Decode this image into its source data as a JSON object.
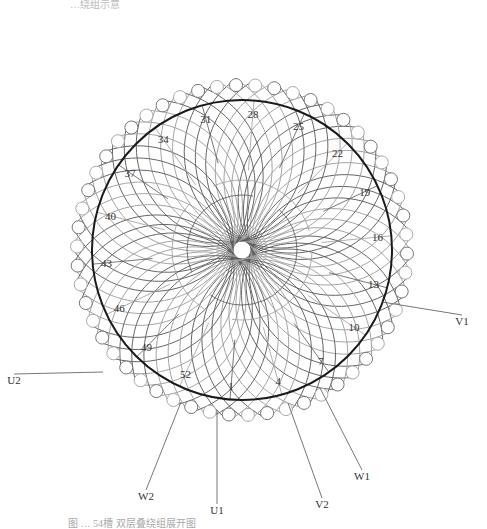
{
  "figure": {
    "top_caption": "…绕组示意",
    "bottom_caption": "图 …  54槽 双层叠绕组展开图",
    "slot_count": 54,
    "center": [
      242,
      250
    ],
    "stator_radius": 150,
    "slot_circle_radius": 165,
    "slot_numbers": [
      {
        "label": "1",
        "slot": 1
      },
      {
        "label": "4",
        "slot": 4
      },
      {
        "label": "7",
        "slot": 7
      },
      {
        "label": "10",
        "slot": 10
      },
      {
        "label": "13",
        "slot": 13
      },
      {
        "label": "16",
        "slot": 16
      },
      {
        "label": "19",
        "slot": 19
      },
      {
        "label": "22",
        "slot": 22
      },
      {
        "label": "25",
        "slot": 25
      },
      {
        "label": "28",
        "slot": 28
      },
      {
        "label": "31",
        "slot": 31
      },
      {
        "label": "34",
        "slot": 34
      },
      {
        "label": "37",
        "slot": 37
      },
      {
        "label": "40",
        "slot": 40
      },
      {
        "label": "43",
        "slot": 43
      },
      {
        "label": "46",
        "slot": 46
      },
      {
        "label": "49",
        "slot": 49
      },
      {
        "label": "52",
        "slot": 52
      }
    ],
    "terminals": [
      {
        "label": "U1",
        "x": 217,
        "y": 514,
        "slot_pos": [
          217,
          410
        ]
      },
      {
        "label": "V2",
        "x": 322,
        "y": 508,
        "slot_pos": [
          288,
          403
        ]
      },
      {
        "label": "W2",
        "x": 146,
        "y": 500,
        "slot_pos": [
          181,
          402
        ]
      },
      {
        "label": "W1",
        "x": 362,
        "y": 480,
        "slot_pos": [
          320,
          388
        ]
      },
      {
        "label": "V1",
        "x": 462,
        "y": 325,
        "slot_pos": [
          382,
          302
        ]
      },
      {
        "label": "U2",
        "x": 14,
        "y": 384,
        "slot_pos": [
          103,
          372
        ]
      }
    ],
    "colors": {
      "stator": "#1a1a1a",
      "coil_dark": "#555555",
      "coil_light": "#9a9a9a",
      "slot": "#777777"
    }
  }
}
